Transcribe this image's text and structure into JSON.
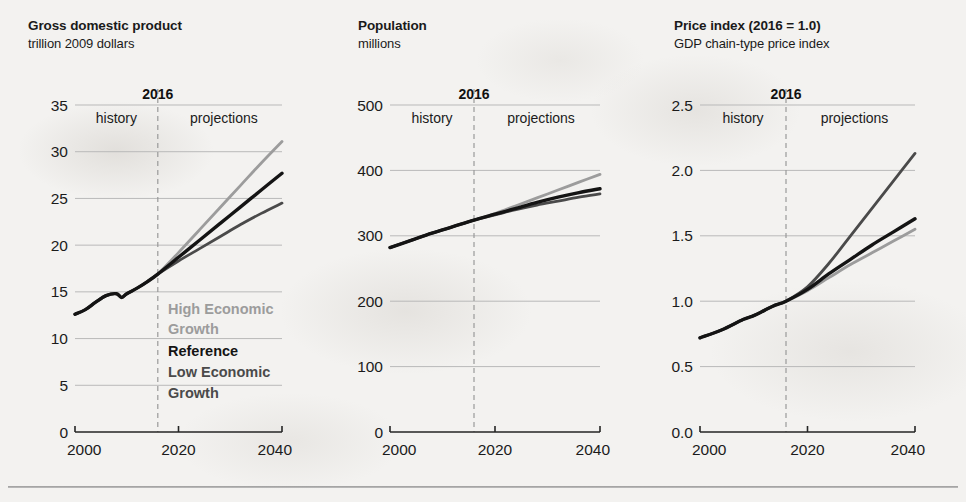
{
  "figure": {
    "background_color": "#f3f2f0",
    "has_bottom_rule": true
  },
  "shared": {
    "history_label": "history",
    "projections_label": "projections",
    "divider_year_label": "2016",
    "divider_year": 2016,
    "x_ticks": [
      "2000",
      "2020",
      "2040"
    ],
    "x_range": [
      2000,
      2040
    ]
  },
  "legend": {
    "items": [
      {
        "label_line1": "High Economic",
        "label_line2": "Growth",
        "key": "high",
        "color": "#9c9c9c"
      },
      {
        "label_line1": "Reference",
        "label_line2": "",
        "key": "reference",
        "color": "#141414"
      },
      {
        "label_line1": "Low Economic",
        "label_line2": "Growth",
        "key": "low",
        "color": "#4a4a4a"
      }
    ],
    "position": "inside-panel-1-lower-right"
  },
  "chart_data": [
    {
      "id": "gross-domestic-product",
      "type": "line",
      "title": "Gross domestic product",
      "subtitle": "trillion 2009 dollars",
      "xlabel": "",
      "ylabel": "",
      "xlim": [
        2000,
        2040
      ],
      "ylim": [
        0,
        35
      ],
      "yticks": [
        0,
        5,
        10,
        15,
        20,
        25,
        30,
        35
      ],
      "ytick_labels": [
        "0",
        "5",
        "10",
        "15",
        "20",
        "25",
        "30",
        "35"
      ],
      "xticks": [
        2000,
        2020,
        2040
      ],
      "xtick_labels": [
        "2000",
        "2020",
        "2040"
      ],
      "grid": true,
      "divider_year": 2016,
      "x": [
        2000,
        2002,
        2004,
        2006,
        2008,
        2009,
        2010,
        2012,
        2014,
        2016,
        2020,
        2024,
        2028,
        2032,
        2036,
        2040
      ],
      "series": [
        {
          "name": "High Economic Growth",
          "color": "#9c9c9c",
          "values": [
            12.6,
            13.1,
            13.9,
            14.6,
            14.8,
            14.4,
            14.8,
            15.4,
            16.1,
            16.9,
            19.2,
            21.6,
            24.0,
            26.4,
            28.8,
            31.1
          ]
        },
        {
          "name": "Reference",
          "color": "#141414",
          "values": [
            12.6,
            13.1,
            13.9,
            14.6,
            14.8,
            14.4,
            14.8,
            15.4,
            16.1,
            16.9,
            18.7,
            20.5,
            22.3,
            24.1,
            25.9,
            27.7
          ]
        },
        {
          "name": "Low Economic Growth",
          "color": "#4a4a4a",
          "values": [
            12.6,
            13.1,
            13.9,
            14.6,
            14.8,
            14.4,
            14.8,
            15.4,
            16.1,
            16.9,
            18.3,
            19.6,
            20.9,
            22.2,
            23.4,
            24.5
          ]
        }
      ]
    },
    {
      "id": "population",
      "type": "line",
      "title": "Population",
      "subtitle": "millions",
      "xlabel": "",
      "ylabel": "",
      "xlim": [
        2000,
        2040
      ],
      "ylim": [
        0,
        500
      ],
      "yticks": [
        0,
        100,
        200,
        300,
        400,
        500
      ],
      "ytick_labels": [
        "0",
        "100",
        "200",
        "300",
        "400",
        "500"
      ],
      "xticks": [
        2000,
        2020,
        2040
      ],
      "xtick_labels": [
        "2000",
        "2020",
        "2040"
      ],
      "grid": true,
      "divider_year": 2016,
      "x": [
        2000,
        2004,
        2008,
        2012,
        2016,
        2020,
        2024,
        2028,
        2032,
        2036,
        2040
      ],
      "series": [
        {
          "name": "High Economic Growth",
          "color": "#9c9c9c",
          "values": [
            282,
            293,
            304,
            314,
            324,
            334,
            346,
            358,
            370,
            382,
            394
          ]
        },
        {
          "name": "Reference",
          "color": "#141414",
          "values": [
            282,
            293,
            304,
            314,
            324,
            333,
            342,
            351,
            359,
            366,
            372
          ]
        },
        {
          "name": "Low Economic Growth",
          "color": "#4a4a4a",
          "values": [
            282,
            293,
            304,
            314,
            324,
            332,
            340,
            347,
            353,
            359,
            364
          ]
        }
      ]
    },
    {
      "id": "price-index",
      "type": "line",
      "title": "Price index (2016 = 1.0)",
      "subtitle": "GDP chain-type price index",
      "xlabel": "",
      "ylabel": "",
      "xlim": [
        2000,
        2040
      ],
      "ylim": [
        0.0,
        2.5
      ],
      "yticks": [
        0.0,
        0.5,
        1.0,
        1.5,
        2.0,
        2.5
      ],
      "ytick_labels": [
        "0.0",
        "0.5",
        "1.0",
        "1.5",
        "2.0",
        "2.5"
      ],
      "xticks": [
        2000,
        2020,
        2040
      ],
      "xtick_labels": [
        "2000",
        "2020",
        "2040"
      ],
      "grid": true,
      "divider_year": 2016,
      "x": [
        2000,
        2004,
        2008,
        2010,
        2012,
        2014,
        2016,
        2020,
        2024,
        2028,
        2032,
        2036,
        2040
      ],
      "series": [
        {
          "name": "High Economic Growth",
          "color": "#9c9c9c",
          "values": [
            0.72,
            0.78,
            0.86,
            0.89,
            0.93,
            0.97,
            1.0,
            1.08,
            1.18,
            1.28,
            1.37,
            1.46,
            1.55
          ]
        },
        {
          "name": "Reference",
          "color": "#141414",
          "values": [
            0.72,
            0.78,
            0.86,
            0.89,
            0.93,
            0.97,
            1.0,
            1.09,
            1.21,
            1.32,
            1.43,
            1.53,
            1.63
          ]
        },
        {
          "name": "Low Economic Growth",
          "color": "#4a4a4a",
          "values": [
            0.72,
            0.78,
            0.86,
            0.89,
            0.93,
            0.97,
            1.0,
            1.11,
            1.29,
            1.5,
            1.71,
            1.92,
            2.13
          ]
        }
      ]
    }
  ]
}
